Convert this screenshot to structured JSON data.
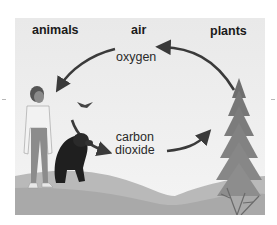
{
  "diagram": {
    "headings": {
      "animals": "animals",
      "air": "air",
      "plants": "plants"
    },
    "gases": {
      "oxygen": "oxygen",
      "carbon_line1": "carbon",
      "carbon_line2": "dioxide"
    },
    "flows": [
      {
        "from": "plants",
        "to": "animals",
        "gas": "oxygen"
      },
      {
        "from": "animals",
        "to": "plants",
        "gas": "carbon dioxide"
      }
    ],
    "illustration": [
      "person",
      "dog",
      "bird",
      "pine tree",
      "hills",
      "shrub"
    ],
    "colors": {
      "background": "#ececec",
      "arrow": "#3a3a3a",
      "text": "#1a1a1a"
    }
  }
}
